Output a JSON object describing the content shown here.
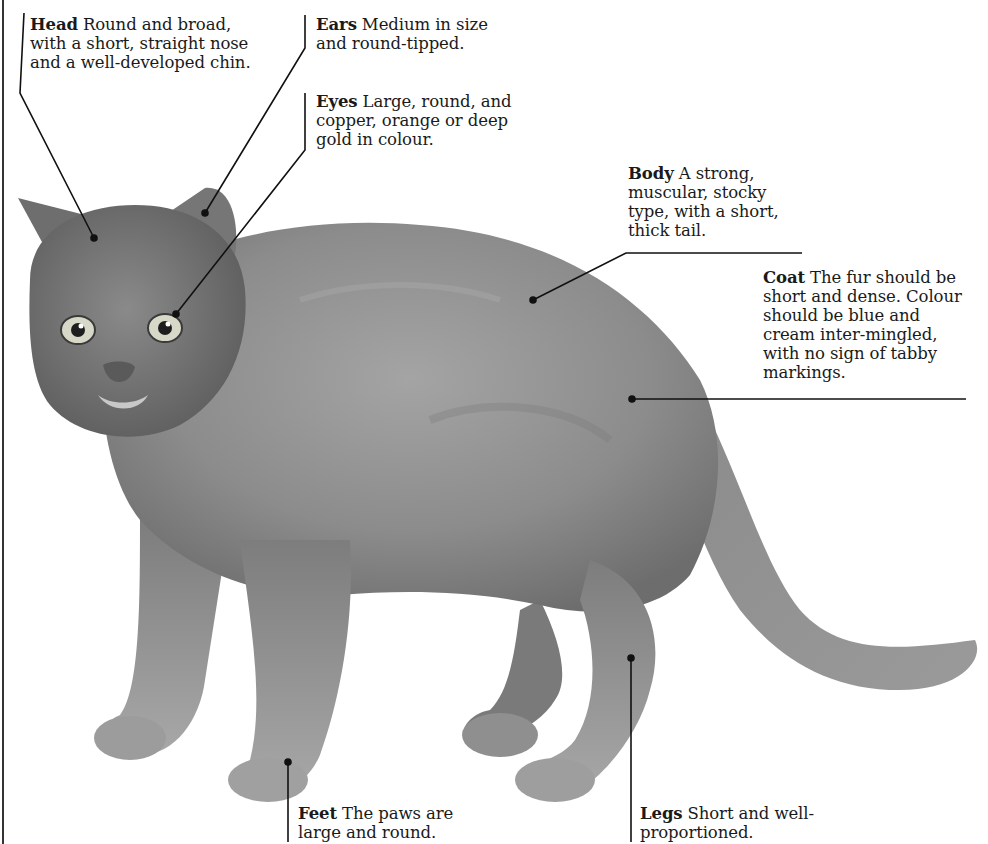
{
  "diagram": {
    "colors": {
      "background": "#ffffff",
      "ink": "#1a1a1a",
      "fur_dark": "#6a6a6a",
      "fur_mid": "#8e8e8e",
      "fur_light": "#b5b5b5"
    },
    "annotations": [
      {
        "id": "head",
        "term": "Head",
        "text": "Round and broad, with a short, straight nose and a well-developed chin."
      },
      {
        "id": "ears",
        "term": "Ears",
        "text": "Medium in size and round-tipped."
      },
      {
        "id": "eyes",
        "term": "Eyes",
        "text": "Large, round, and copper, orange or deep gold in colour."
      },
      {
        "id": "body",
        "term": "Body",
        "text": "A strong, muscular, stocky type, with a short, thick tail."
      },
      {
        "id": "coat",
        "term": "Coat",
        "text": "The fur should be short and dense. Colour should be blue and cream inter-mingled, with no sign of tabby markings."
      },
      {
        "id": "feet",
        "term": "Feet",
        "text": "The paws are large and round."
      },
      {
        "id": "legs",
        "term": "Legs",
        "text": "Short and well-proportioned."
      }
    ]
  }
}
